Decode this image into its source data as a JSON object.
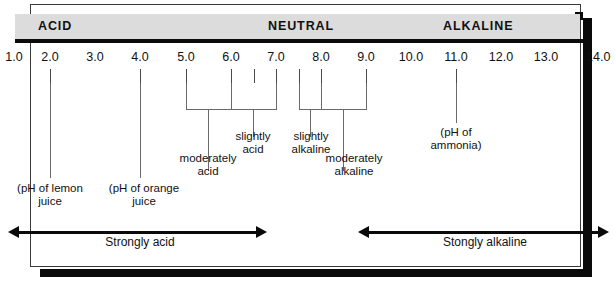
{
  "diagram": {
    "band_labels": [
      {
        "text": "ACID",
        "x": 38
      },
      {
        "text": "NEUTRAL",
        "x": 268
      },
      {
        "text": "ALKALINE",
        "x": 443
      }
    ],
    "scale": {
      "min": 1.0,
      "max": 14.0,
      "ticks": [
        {
          "label": "1.0",
          "x": 14
        },
        {
          "label": "2.0",
          "x": 50
        },
        {
          "label": "3.0",
          "x": 95
        },
        {
          "label": "4.0",
          "x": 140
        },
        {
          "label": "5.0",
          "x": 186
        },
        {
          "label": "6.0",
          "x": 231
        },
        {
          "label": "7.0",
          "x": 276
        },
        {
          "label": "8.0",
          "x": 321
        },
        {
          "label": "9.0",
          "x": 366
        },
        {
          "label": "10.0",
          "x": 411
        },
        {
          "label": "11.0",
          "x": 456
        },
        {
          "label": "12.0",
          "x": 501
        },
        {
          "label": "13.0",
          "x": 546
        },
        {
          "label": "14.0",
          "x": 597
        }
      ]
    },
    "callouts": [
      {
        "name": "lemon-juice",
        "line1": "(pH of lemon",
        "line2": "juice",
        "value": 2.0
      },
      {
        "name": "orange-juice",
        "line1": "(pH of orange",
        "line2": "juice",
        "value": 4.0
      },
      {
        "name": "ammonia",
        "line1": "(pH of",
        "line2": "ammonia)",
        "value": 11.0
      }
    ],
    "ranges": [
      {
        "name": "moderately-acid",
        "line1": "moderately",
        "line2": "acid",
        "from": 5.0,
        "to": 6.0
      },
      {
        "name": "slightly-acid",
        "line1": "slightly",
        "line2": "acid",
        "from": 6.0,
        "to": 7.0
      },
      {
        "name": "slightly-alkaline",
        "line1": "slightly",
        "line2": "alkaline",
        "from": 7.0,
        "to": 8.0
      },
      {
        "name": "moderately-alkaline",
        "line1": "moderately",
        "line2": "alkaline",
        "from": 8.0,
        "to": 9.0
      }
    ],
    "arrows": [
      {
        "name": "strongly-acid",
        "label": "Strongly acid",
        "from": 1.0,
        "to": 7.0
      },
      {
        "name": "strongly-alkaline",
        "label": "Stongly alkaline",
        "from": 8.0,
        "to": 14.0
      }
    ],
    "colors": {
      "band": "#dcdcdc",
      "rule": "#0b0b0b",
      "frame": "#3a3a3a",
      "shadow": "#0a0a0a",
      "text": "#111111",
      "leader": "#6a6a6a"
    }
  }
}
